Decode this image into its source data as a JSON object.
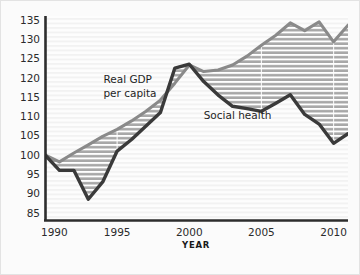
{
  "chart_data": {
    "type": "line",
    "title": "",
    "subtitle": "",
    "xlabel": "YEAR",
    "ylabel": "",
    "xlim": [
      1990,
      2011
    ],
    "ylim": [
      83,
      136
    ],
    "grid": true,
    "grid_orientation": "horizontal",
    "legend": "inline-annotations",
    "x": [
      1990,
      1991,
      1992,
      1993,
      1994,
      1995,
      1996,
      1997,
      1998,
      1999,
      2000,
      2001,
      2002,
      2003,
      2004,
      2005,
      2006,
      2007,
      2008,
      2009,
      2010,
      2011
    ],
    "xtick_labels": [
      "1990",
      "1995",
      "2000",
      "2005",
      "2010"
    ],
    "xticks": [
      1990,
      1995,
      2000,
      2005,
      2010
    ],
    "ytick_labels": [
      "85",
      "90",
      "95",
      "100",
      "105",
      "110",
      "115",
      "120",
      "125",
      "130",
      "135"
    ],
    "yticks": [
      85,
      90,
      95,
      100,
      105,
      110,
      115,
      120,
      125,
      130,
      135
    ],
    "series": [
      {
        "name": "Real GDP per capita",
        "color": "#8a8a8a",
        "values": [
          100.0,
          98.2,
          100.5,
          102.6,
          104.8,
          106.6,
          108.8,
          111.3,
          114.2,
          118.6,
          123.3,
          121.6,
          122.0,
          123.3,
          125.6,
          128.4,
          131.0,
          134.2,
          132.2,
          134.5,
          129.3,
          133.6
        ]
      },
      {
        "name": "Social health",
        "color": "#3a3a3a",
        "values": [
          100.0,
          96.0,
          96.0,
          88.5,
          93.0,
          101.0,
          104.0,
          107.5,
          111.0,
          122.5,
          123.5,
          119.0,
          115.5,
          112.6,
          112.0,
          111.3,
          113.4,
          115.6,
          110.5,
          108.0,
          103.0,
          105.5
        ]
      }
    ],
    "fill_between": {
      "upper_series": "Real GDP per capita",
      "lower_series": "Social health",
      "fill_color": "#a8a8a8",
      "hatch": "horizontal-white-lines"
    },
    "annotations": [
      {
        "text": "Real GDP",
        "x": 1994.05,
        "y": 118.6
      },
      {
        "text": "per capita",
        "x": 1994.05,
        "y": 115.0
      },
      {
        "text": "Social health",
        "x": 2001.0,
        "y": 109.2
      }
    ]
  },
  "axis": {
    "x_title": "YEAR",
    "axis_color": "#2d2d2d"
  },
  "colors": {
    "background": "#fbfbfb",
    "plot_background": "#fafafa",
    "gdp_line": "#8a8a8a",
    "social_health_line": "#3a3a3a",
    "band_fill": "#a8a8a8",
    "band_hatch": "#ffffff",
    "gridline": "#ececec",
    "text": "#2b2b2b"
  }
}
